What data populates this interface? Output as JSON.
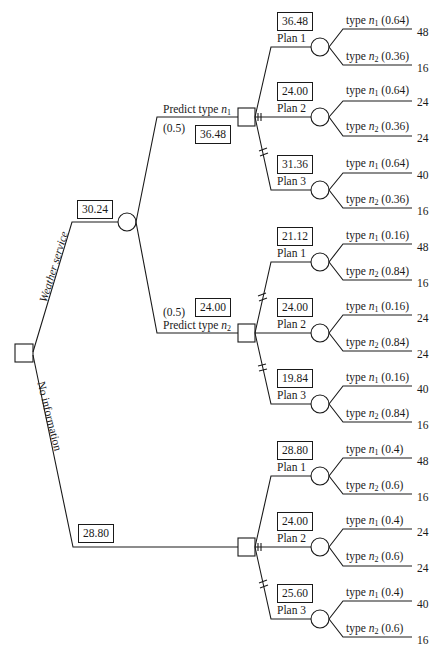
{
  "diagram": {
    "type": "decision-tree",
    "root": {
      "branches": [
        {
          "label": "Weather service",
          "expected_value": "30.24"
        },
        {
          "label": "No information",
          "expected_value": "28.80"
        }
      ]
    },
    "weather_service": {
      "predictions": [
        {
          "label_prefix": "Predict type ",
          "var": "n",
          "sub": "1",
          "probability": "(0.5)",
          "expected_value": "36.48",
          "plans": [
            {
              "label": "Plan 1",
              "value": "36.48",
              "outcomes": [
                {
                  "text": "type ",
                  "var": "n",
                  "sub": "1",
                  "prob": " (0.64)",
                  "payoff": "48"
                },
                {
                  "text": "type ",
                  "var": "n",
                  "sub": "2",
                  "prob": " (0.36)",
                  "payoff": "16"
                }
              ]
            },
            {
              "label": "Plan 2",
              "value": "24.00",
              "outcomes": [
                {
                  "text": "type ",
                  "var": "n",
                  "sub": "1",
                  "prob": " (0.64)",
                  "payoff": "24"
                },
                {
                  "text": "type ",
                  "var": "n",
                  "sub": "2",
                  "prob": " (0.36)",
                  "payoff": "24"
                }
              ]
            },
            {
              "label": "Plan 3",
              "value": "31.36",
              "outcomes": [
                {
                  "text": "type ",
                  "var": "n",
                  "sub": "1",
                  "prob": " (0.64)",
                  "payoff": "40"
                },
                {
                  "text": "type ",
                  "var": "n",
                  "sub": "2",
                  "prob": " (0.36)",
                  "payoff": "16"
                }
              ]
            }
          ]
        },
        {
          "label_prefix": "Predict type ",
          "var": "n",
          "sub": "2",
          "probability": "(0.5)",
          "expected_value": "24.00",
          "plans": [
            {
              "label": "Plan 1",
              "value": "21.12",
              "outcomes": [
                {
                  "text": "type ",
                  "var": "n",
                  "sub": "1",
                  "prob": " (0.16)",
                  "payoff": "48"
                },
                {
                  "text": "type ",
                  "var": "n",
                  "sub": "2",
                  "prob": " (0.84)",
                  "payoff": "16"
                }
              ]
            },
            {
              "label": "Plan 2",
              "value": "24.00",
              "outcomes": [
                {
                  "text": "type ",
                  "var": "n",
                  "sub": "1",
                  "prob": " (0.16)",
                  "payoff": "24"
                },
                {
                  "text": "type ",
                  "var": "n",
                  "sub": "2",
                  "prob": " (0.84)",
                  "payoff": "24"
                }
              ]
            },
            {
              "label": "Plan 3",
              "value": "19.84",
              "outcomes": [
                {
                  "text": "type ",
                  "var": "n",
                  "sub": "1",
                  "prob": " (0.16)",
                  "payoff": "40"
                },
                {
                  "text": "type ",
                  "var": "n",
                  "sub": "2",
                  "prob": " (0.84)",
                  "payoff": "16"
                }
              ]
            }
          ]
        }
      ]
    },
    "no_information": {
      "expected_value": "28.80",
      "plans": [
        {
          "label": "Plan 1",
          "value": "28.80",
          "outcomes": [
            {
              "text": "type ",
              "var": "n",
              "sub": "1",
              "prob": " (0.4)",
              "payoff": "48"
            },
            {
              "text": "type ",
              "var": "n",
              "sub": "2",
              "prob": " (0.6)",
              "payoff": "16"
            }
          ]
        },
        {
          "label": "Plan 2",
          "value": "24.00",
          "outcomes": [
            {
              "text": "type ",
              "var": "n",
              "sub": "1",
              "prob": " (0.4)",
              "payoff": "24"
            },
            {
              "text": "type ",
              "var": "n",
              "sub": "2",
              "prob": " (0.6)",
              "payoff": "24"
            }
          ]
        },
        {
          "label": "Plan 3",
          "value": "25.60",
          "outcomes": [
            {
              "text": "type ",
              "var": "n",
              "sub": "1",
              "prob": " (0.4)",
              "payoff": "40"
            },
            {
              "text": "type ",
              "var": "n",
              "sub": "2",
              "prob": " (0.6)",
              "payoff": "16"
            }
          ]
        }
      ]
    },
    "colors": {
      "line": "#1a1a1a",
      "background": "#ffffff"
    }
  }
}
